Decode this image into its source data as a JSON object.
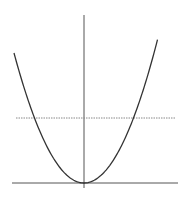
{
  "diagram": {
    "curve": {
      "function": "y = x^2",
      "x_range": [
        -1.0,
        1.05
      ],
      "vertex": [
        0,
        0
      ]
    },
    "level_line": {
      "y_value": 0.5,
      "style": "dashed"
    },
    "colors": {
      "curve": "#333333",
      "axis": "#555555",
      "level_line": "#888888",
      "background": "#ffffff"
    }
  }
}
